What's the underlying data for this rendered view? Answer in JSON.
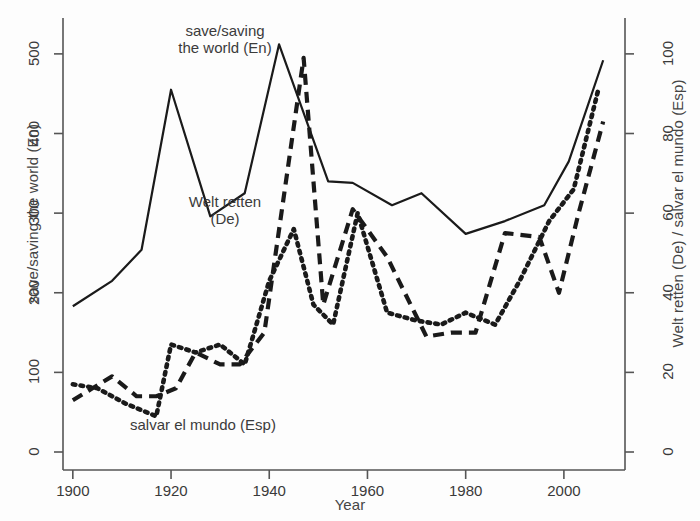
{
  "figure": {
    "background": "#fdfdfd",
    "line_color": "#1a1a1a"
  },
  "axes": {
    "x": {
      "label": "Year",
      "ticks": [
        1900,
        1920,
        1940,
        1960,
        1980,
        2000
      ],
      "tick_labels": [
        "1900",
        "1920",
        "1940",
        "1960",
        "1980",
        "2000"
      ],
      "range": [
        1898,
        2010
      ]
    },
    "y_left": {
      "label": "save/saving the world (En)",
      "ticks": [
        0,
        100,
        200,
        300,
        400,
        500
      ],
      "tick_labels": [
        "0",
        "100",
        "200",
        "300",
        "400",
        "500"
      ],
      "range": [
        0,
        530
      ]
    },
    "y_right": {
      "label": "Welt retten (De) / salvar el mundo (Esp)",
      "ticks": [
        0,
        20,
        40,
        60,
        80,
        100
      ],
      "tick_labels": [
        "0",
        "20",
        "40",
        "60",
        "80",
        "100"
      ],
      "range": [
        0,
        106
      ]
    }
  },
  "annotations": {
    "en": "save/saving\nthe world (En)",
    "de": "Welt retten\n(De)",
    "esp": "salvar el mundo (Esp)"
  },
  "chart_data": {
    "type": "line",
    "title": "",
    "xlabel": "Year",
    "ylabel": "save/saving the world (En)",
    "ylabel_right": "Welt retten (De) / salvar el mundo (Esp)",
    "xlim": [
      1898,
      2010
    ],
    "ylim": [
      0,
      530
    ],
    "ylim_right": [
      0,
      106
    ],
    "grid": false,
    "legend": "inline-annotations",
    "series": [
      {
        "name": "save/saving the world (En)",
        "axis": "left",
        "style": "solid",
        "x": [
          1900,
          1908,
          1914,
          1920,
          1928,
          1935,
          1942,
          1952,
          1957,
          1965,
          1971,
          1980,
          1988,
          1996,
          2001,
          2008
        ],
        "values": [
          183,
          215,
          254,
          455,
          296,
          325,
          512,
          340,
          338,
          310,
          325,
          274,
          290,
          310,
          365,
          492
        ]
      },
      {
        "name": "Welt retten (De)",
        "axis": "right",
        "style": "dashed",
        "x": [
          1900,
          1904,
          1908,
          1913,
          1917,
          1921,
          1925,
          1930,
          1934,
          1939,
          1947,
          1951,
          1957,
          1964,
          1972,
          1977,
          1982,
          1988,
          1995,
          1999,
          2003,
          2008
        ],
        "values": [
          13,
          16,
          19,
          14,
          14,
          16,
          25,
          22,
          22,
          30,
          99,
          37,
          61,
          49,
          29,
          30,
          30,
          55,
          54,
          40,
          60,
          83
        ]
      },
      {
        "name": "salvar el mundo (Esp)",
        "axis": "right",
        "style": "dotted",
        "x": [
          1900,
          1905,
          1911,
          1917,
          1920,
          1925,
          1930,
          1935,
          1940,
          1945,
          1949,
          1953,
          1958,
          1964,
          1970,
          1975,
          1980,
          1986,
          1991,
          1997,
          2002,
          2007
        ],
        "values": [
          17,
          16,
          12,
          9,
          27,
          25,
          27,
          22,
          43,
          56,
          37,
          32,
          60,
          35,
          33,
          32,
          35,
          32,
          43,
          58,
          66,
          91
        ]
      }
    ]
  }
}
